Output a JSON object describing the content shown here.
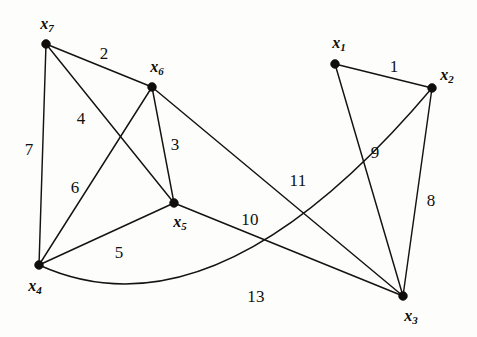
{
  "figure": {
    "width": 477,
    "height": 337,
    "background_color": "#fdfdfb",
    "line_color": "#15130f",
    "vertex_color": "#100e0b"
  },
  "chart_data": {
    "type": "diagram",
    "subtype": "weighted-graph",
    "title": "",
    "xlabel": "",
    "ylabel": "",
    "grid": false,
    "legend": "none",
    "nodes": [
      {
        "id": "x1",
        "label": "x",
        "subscript": "1",
        "x": 335,
        "y": 64,
        "label_x": 339,
        "label_y": 44
      },
      {
        "id": "x2",
        "label": "x",
        "subscript": "2",
        "x": 432,
        "y": 88,
        "label_x": 447,
        "label_y": 76
      },
      {
        "id": "x3",
        "label": "x",
        "subscript": "3",
        "x": 403,
        "y": 296,
        "label_x": 411,
        "label_y": 317
      },
      {
        "id": "x4",
        "label": "x",
        "subscript": "4",
        "x": 39,
        "y": 265,
        "label_x": 35,
        "label_y": 287
      },
      {
        "id": "x5",
        "label": "x",
        "subscript": "5",
        "x": 174,
        "y": 203,
        "label_x": 180,
        "label_y": 223
      },
      {
        "id": "x6",
        "label": "x",
        "subscript": "6",
        "x": 152,
        "y": 87,
        "label_x": 157,
        "label_y": 68
      },
      {
        "id": "x7",
        "label": "x",
        "subscript": "7",
        "x": 46,
        "y": 44,
        "label_x": 47,
        "label_y": 25
      }
    ],
    "edges": [
      {
        "source": "x1",
        "target": "x2",
        "weight": 1,
        "curved": false,
        "label_x": 394,
        "label_y": 66
      },
      {
        "source": "x7",
        "target": "x6",
        "weight": 2,
        "curved": false,
        "label_x": 104,
        "label_y": 53
      },
      {
        "source": "x6",
        "target": "x5",
        "weight": 3,
        "curved": false,
        "label_x": 175,
        "label_y": 144
      },
      {
        "source": "x7",
        "target": "x5",
        "weight": 4,
        "curved": false,
        "label_x": 81,
        "label_y": 118
      },
      {
        "source": "x4",
        "target": "x5",
        "weight": 5,
        "curved": false,
        "label_x": 119,
        "label_y": 252
      },
      {
        "source": "x6",
        "target": "x4",
        "weight": 6,
        "curved": false,
        "label_x": 75,
        "label_y": 187
      },
      {
        "source": "x7",
        "target": "x4",
        "weight": 7,
        "curved": false,
        "label_x": 29,
        "label_y": 149
      },
      {
        "source": "x2",
        "target": "x3",
        "weight": 8,
        "curved": false,
        "label_x": 431,
        "label_y": 200
      },
      {
        "source": "x1",
        "target": "x3",
        "weight": 9,
        "curved": false,
        "label_x": 375,
        "label_y": 152
      },
      {
        "source": "x5",
        "target": "x3",
        "weight": 10,
        "curved": false,
        "label_x": 250,
        "label_y": 219
      },
      {
        "source": "x6",
        "target": "x3",
        "weight": 11,
        "curved": false,
        "label_x": 298,
        "label_y": 180
      },
      {
        "source": "x2",
        "target": "x4",
        "weight": 13,
        "curved": true,
        "curve_cx": 215,
        "curve_cy": 345,
        "label_x": 256,
        "label_y": 296
      }
    ],
    "weights": [
      1,
      2,
      3,
      4,
      5,
      6,
      7,
      8,
      9,
      10,
      11,
      13
    ],
    "vertex_count": 7,
    "edge_count": 12
  }
}
